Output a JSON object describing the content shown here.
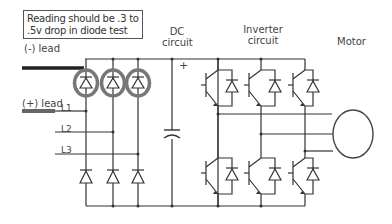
{
  "note": {
    "line1": "Reading should be .3 to",
    "line2": ".5v drop in diode test"
  },
  "leads": {
    "negative": "(-) lead",
    "positive": "(+) lead"
  },
  "lines": [
    "L1",
    "L2",
    "L3"
  ],
  "sections": {
    "dc_circuit": {
      "line1": "DC",
      "line2": "circuit"
    },
    "inverter_circuit": {
      "line1": "Inverter",
      "line2": "circuit"
    },
    "motor": "Motor"
  },
  "symbols": {
    "plus": "+"
  },
  "colors": {
    "wire": "#333333",
    "lead_negative": "#222222",
    "lead_positive": "#666666",
    "highlight_ring": "#777777"
  }
}
